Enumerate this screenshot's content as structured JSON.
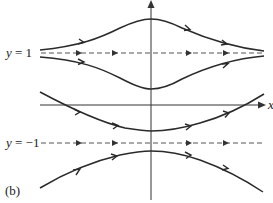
{
  "figure": {
    "panel_label": "(b)",
    "axes": {
      "x_label": "x",
      "y_label": ""
    },
    "equilibria": [
      {
        "label_var": "y",
        "label_eq": " = 1",
        "value": 1
      },
      {
        "label_var": "y",
        "label_eq": " = −1",
        "value": -1
      }
    ],
    "colors": {
      "stroke": "#2a2a2a",
      "dashed": "#555555",
      "axis": "#333333"
    },
    "solution_curves": [
      {
        "name": "above-y1",
        "description": "bulges upward near x=0, approaches y=1 as x goes to ±∞"
      },
      {
        "name": "between-upper",
        "description": "dips toward x-axis near x=0, approaches y=1 as x goes to ±∞"
      },
      {
        "name": "between-lower",
        "description": "U-shaped, lies just above y=-1 near x=0, rises past x-axis at both ends"
      },
      {
        "name": "below-y-minus-1",
        "description": "arch lies just below y=-1 near x=0, falls away at both ends"
      }
    ]
  }
}
